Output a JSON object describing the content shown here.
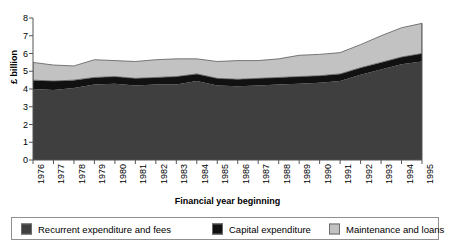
{
  "chart_data": {
    "type": "area",
    "stacked": true,
    "title": "",
    "xlabel": "Financial year beginning",
    "ylabel": "£ billion",
    "ylim": [
      0,
      8
    ],
    "ytick_step": 1,
    "yticks": [
      "0",
      "1",
      "2",
      "3",
      "4",
      "5",
      "6",
      "7",
      "8"
    ],
    "grid": false,
    "legend_position": "bottom",
    "x": [
      "1976",
      "1977",
      "1978",
      "1979",
      "1980",
      "1981",
      "1982",
      "1983",
      "1984",
      "1985",
      "1986",
      "1987",
      "1988",
      "1989",
      "1990",
      "1991",
      "1992",
      "1993",
      "1994",
      "1995"
    ],
    "categories": [
      "1976",
      "1977",
      "1978",
      "1979",
      "1980",
      "1981",
      "1982",
      "1983",
      "1984",
      "1985",
      "1986",
      "1987",
      "1988",
      "1989",
      "1990",
      "1991",
      "1992",
      "1993",
      "1994",
      "1995"
    ],
    "series": [
      {
        "name": "Recurrent expenditure and fees",
        "color": "#3f3f3f",
        "values": [
          4.0,
          3.95,
          4.05,
          4.25,
          4.3,
          4.2,
          4.25,
          4.25,
          4.45,
          4.2,
          4.15,
          4.2,
          4.25,
          4.3,
          4.35,
          4.45,
          4.8,
          5.1,
          5.4,
          5.55
        ]
      },
      {
        "name": "Capital expenditure",
        "color": "#111111",
        "values": [
          0.5,
          0.5,
          0.45,
          0.4,
          0.4,
          0.4,
          0.4,
          0.45,
          0.4,
          0.4,
          0.4,
          0.4,
          0.4,
          0.4,
          0.4,
          0.4,
          0.4,
          0.4,
          0.4,
          0.45
        ]
      },
      {
        "name": "Maintenance and loans",
        "color": "#c2c2c2",
        "values": [
          1.0,
          0.9,
          0.8,
          1.0,
          0.9,
          0.95,
          1.0,
          1.0,
          0.85,
          0.95,
          1.05,
          1.0,
          1.05,
          1.2,
          1.2,
          1.2,
          1.3,
          1.5,
          1.65,
          1.7
        ]
      }
    ],
    "totals": [
      5.5,
      5.35,
      5.3,
      5.65,
      5.6,
      5.55,
      5.65,
      5.7,
      5.7,
      5.55,
      5.6,
      5.6,
      5.7,
      5.9,
      5.95,
      6.05,
      6.5,
      7.0,
      7.45,
      7.7
    ]
  },
  "legend": {
    "items": [
      {
        "label": "Recurrent expenditure and fees",
        "color": "#3f3f3f"
      },
      {
        "label": "Capital expenditure",
        "color": "#111111"
      },
      {
        "label": "Maintenance and loans",
        "color": "#c2c2c2"
      }
    ]
  },
  "axis": {
    "x_title": "Financial year beginning",
    "y_title": "£ billion"
  },
  "colors": {
    "axis": "#555555",
    "legend_border": "#8f8f8f",
    "background": "#ffffff"
  }
}
